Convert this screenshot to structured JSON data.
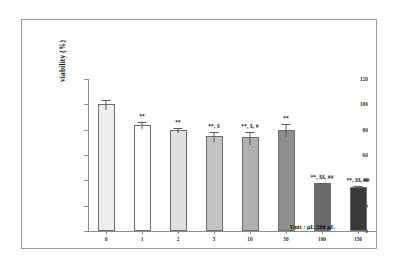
{
  "figure": {
    "unit_note": "Unit : μL/200 μL"
  },
  "chart_data": {
    "type": "bar",
    "title": "",
    "xlabel": "",
    "ylabel": "viability (%)",
    "ylim": [
      0,
      120
    ],
    "yticks": [
      "0",
      "20",
      "40",
      "60",
      "80",
      "100",
      "120"
    ],
    "grid": false,
    "legend": "none",
    "categories": [
      "0",
      "1",
      "2",
      "5",
      "10",
      "50",
      "100",
      "150"
    ],
    "values": [
      100,
      84,
      80,
      75,
      74,
      80,
      38,
      35
    ],
    "errors": [
      4,
      3,
      2,
      4,
      5,
      5,
      1,
      1
    ],
    "bar_colors": [
      "#ededed",
      "#ffffff",
      "#e0e0e0",
      "#c3c3c3",
      "#b0b0b0",
      "#8f8f8f",
      "#6a6a6a",
      "#3a3a3a"
    ],
    "annotations": [
      "",
      "**",
      "**",
      "**, $",
      "**, $, #",
      "**",
      "**, $$, ##",
      "**, $$, ##"
    ]
  }
}
